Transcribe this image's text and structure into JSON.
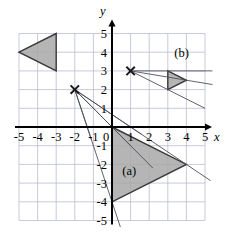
{
  "figure": {
    "title": "",
    "axes": {
      "x_name": "x",
      "y_name": "y",
      "x_ticks": [
        "-5",
        "-4",
        "-3",
        "-2",
        "-1",
        "0",
        "1",
        "2",
        "3",
        "4",
        "5"
      ],
      "y_ticks": [
        "5",
        "4",
        "3",
        "2",
        "1",
        "0",
        "-1",
        "-2",
        "-3",
        "-4",
        "-5"
      ],
      "x_range": [
        -5,
        5
      ],
      "y_range": [
        -5,
        5
      ],
      "grid": true,
      "grid_color": "#b9bcd0",
      "axis_color": "#000000"
    },
    "labels": {
      "shape_a": "(a)",
      "shape_b": "(b)"
    },
    "colors": {
      "fill": "#a8a8a8",
      "outline": "#3a3a3a",
      "ray": "#4a4a55",
      "background": "#ffffff"
    }
  },
  "chart_data": {
    "type": "scatter",
    "title": "",
    "xlabel": "x",
    "ylabel": "y",
    "xlim": [
      -5,
      5
    ],
    "ylim": [
      -5,
      5
    ],
    "grid": true,
    "polygons": [
      {
        "name": "preimage",
        "label": "",
        "vertices": [
          [
            -5,
            4
          ],
          [
            -3,
            5
          ],
          [
            -3,
            3
          ]
        ],
        "filled": true
      },
      {
        "name": "image-a",
        "label": "(a)",
        "label_position": [
          0.55,
          -2.55
        ],
        "vertices": [
          [
            0,
            0
          ],
          [
            0,
            -4
          ],
          [
            4,
            -2
          ]
        ],
        "filled": true
      },
      {
        "name": "image-b",
        "label": "(b)",
        "label_position": [
          3.35,
          3.75
        ],
        "vertices": [
          [
            3,
            3
          ],
          [
            3,
            2
          ],
          [
            4,
            2.5
          ]
        ],
        "filled": true
      }
    ],
    "centers": [
      {
        "name": "center-1",
        "x": -2,
        "y": 2,
        "marker": "x"
      },
      {
        "name": "center-2",
        "x": 1,
        "y": 3,
        "marker": "x"
      }
    ],
    "rays": [
      {
        "from": [
          -2,
          2
        ],
        "through": [
          -5,
          4
        ],
        "to": [
          1.6,
          -0.4
        ]
      },
      {
        "from": [
          -2,
          2
        ],
        "through": [
          -3,
          5
        ],
        "to": [
          -1.1,
          -0.7
        ]
      },
      {
        "from": [
          -2,
          2
        ],
        "through": [
          -3,
          3
        ],
        "to": [
          1.0,
          -1.0
        ]
      },
      {
        "from": [
          1,
          3
        ],
        "through": [
          -5,
          4
        ],
        "to": [
          5.4,
          2.27
        ]
      },
      {
        "from": [
          1,
          3
        ],
        "through": [
          -3,
          5
        ],
        "to": [
          5.0,
          1.0
        ]
      },
      {
        "from": [
          1,
          3
        ],
        "through": [
          -3,
          3
        ],
        "to": [
          5.4,
          3.0
        ]
      },
      {
        "from": [
          -2,
          2
        ],
        "through": [
          0,
          0
        ],
        "to": [
          2.2,
          -2.2
        ]
      },
      {
        "from": [
          -2,
          2
        ],
        "through": [
          0,
          -4
        ],
        "to": [
          0.45,
          -5.35
        ]
      },
      {
        "from": [
          -2,
          2
        ],
        "through": [
          4,
          -2
        ],
        "to": [
          5.3,
          -2.87
        ]
      }
    ]
  }
}
